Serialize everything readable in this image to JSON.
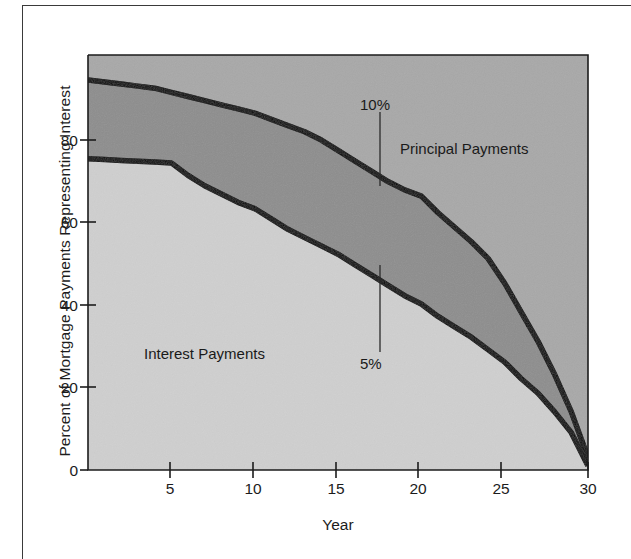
{
  "figure": {
    "background": "#ffffff",
    "frame_color": "#3a3a3a"
  },
  "chart_data": {
    "type": "area",
    "title": "",
    "subtitle": "",
    "xlabel": "Year",
    "ylabel": "Percent of Mortgage Payments Representing Interest",
    "xlim": [
      0,
      30
    ],
    "ylim": [
      0,
      100
    ],
    "xticks": [
      5,
      10,
      15,
      20,
      25,
      30
    ],
    "yticks": [
      0,
      20,
      40,
      60,
      80
    ],
    "grid": false,
    "legend_position": "in-plot annotations",
    "x": [
      0,
      1,
      2,
      3,
      4,
      5,
      6,
      7,
      8,
      9,
      10,
      11,
      12,
      13,
      14,
      15,
      16,
      17,
      18,
      19,
      20,
      21,
      22,
      23,
      24,
      25,
      26,
      27,
      28,
      29,
      30
    ],
    "series": [
      {
        "name": "10%",
        "annotation": "10%",
        "description": "Upper boundary curve: interest share of mortgage payment at a 10% interest rate",
        "values": [
          94,
          93.5,
          93,
          92.5,
          92,
          91,
          90,
          89,
          88,
          87,
          86,
          84.5,
          83,
          81.5,
          79.5,
          77,
          74.5,
          72,
          69.5,
          67.5,
          66,
          62,
          58.5,
          55,
          51,
          45,
          38,
          31,
          23,
          14,
          3
        ]
      },
      {
        "name": "5%",
        "annotation": "5%",
        "description": "Lower boundary curve: interest share of mortgage payment at a 5% interest rate",
        "values": [
          75,
          74.8,
          74.6,
          74.4,
          74.2,
          74,
          71,
          68.5,
          66.5,
          64.5,
          63,
          60.5,
          58,
          56,
          54,
          52,
          49.5,
          47,
          44.5,
          42,
          40,
          37,
          34.5,
          32,
          29,
          26,
          22,
          18.5,
          14,
          9,
          1
        ]
      }
    ],
    "regions": [
      {
        "name": "Principal Payments",
        "label": "Principal Payments",
        "fill": "#a8a8a8",
        "description": "Area above the 10% curve"
      },
      {
        "name": "between-rates",
        "label": "",
        "fill": "#8d8d8d",
        "description": "Band between the 10% and 5% curves"
      },
      {
        "name": "Interest Payments",
        "label": "Interest Payments",
        "fill": "#cfcfcf",
        "description": "Area below the 5% curve"
      }
    ],
    "annotations": [
      {
        "text": "10%",
        "leader": "points down to the 10% curve",
        "x_year": 17.5
      },
      {
        "text": "5%",
        "leader": "points up to the 5% curve",
        "x_year": 17.5
      },
      {
        "text": "Principal Payments",
        "leader": "none",
        "x_year": 21
      },
      {
        "text": "Interest Payments",
        "leader": "none",
        "x_year": 5
      }
    ],
    "colors": {
      "curve_line": "#000000",
      "principal_fill": "#a8a8a8",
      "band_fill": "#8d8d8d",
      "interest_fill": "#cfcfcf",
      "axis": "#1c1c1c",
      "text": "#1c1c1c"
    }
  },
  "axes": {
    "y_title": "Percent of Mortgage Payments Representing Interest",
    "x_title": "Year",
    "y_tick_labels": [
      "80",
      "60",
      "40",
      "20",
      "0"
    ],
    "x_tick_labels": [
      "5",
      "10",
      "15",
      "20",
      "25",
      "30"
    ]
  },
  "notes": {
    "principal": "Principal Payments",
    "interest": "Interest Payments",
    "ten_percent": "10%",
    "five_percent": "5%"
  }
}
